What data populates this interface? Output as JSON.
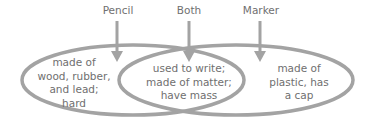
{
  "diagram": {
    "type": "venn",
    "stroke_color": "#a0a0a0",
    "labels": {
      "left": "Pencil",
      "center": "Both",
      "right": "Marker"
    },
    "regions": {
      "left": [
        "made of",
        "wood, rubber,",
        "and lead;",
        "hard"
      ],
      "center": [
        "used to write;",
        "made of matter;",
        "have mass"
      ],
      "right": [
        "made of",
        "plastic, has",
        "a cap"
      ]
    }
  }
}
